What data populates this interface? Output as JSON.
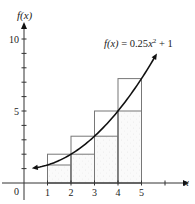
{
  "chart_data": {
    "type": "line",
    "title": "",
    "function_label": "f(x) = 0.25x² + 1",
    "function_label_parts": {
      "lhs": "f(x)",
      "eq": " = 0.25",
      "var": "x",
      "exp": "2",
      "tail": " + 1"
    },
    "xlabel": "x",
    "ylabel": "f(x)",
    "origin_label": "0",
    "xlim": [
      0,
      6.6
    ],
    "ylim": [
      0,
      11
    ],
    "x_ticks": [
      1,
      2,
      3,
      4,
      5,
      6
    ],
    "x_tick_labels": [
      "1",
      "2",
      "3",
      "4",
      "5"
    ],
    "y_ticks": [
      1,
      2,
      3,
      4,
      5,
      6,
      7,
      8,
      9,
      10
    ],
    "y_tick_labels": [
      {
        "value": 5,
        "label": "5"
      },
      {
        "value": 10,
        "label": "10"
      }
    ],
    "grid": false,
    "curve": {
      "a": 0.25,
      "b": 0,
      "c": 1,
      "x_start": 0.5,
      "x_end": 5.57
    },
    "series": [
      {
        "name": "f(x) = 0.25x^2 + 1",
        "x": [
          0.5,
          1,
          2,
          3,
          4,
          5,
          5.57
        ],
        "values": [
          1.0625,
          1.25,
          2,
          3.25,
          5,
          7.25,
          8.76
        ]
      }
    ],
    "rectangles": {
      "inscribed_shaded": [
        {
          "x0": 1,
          "x1": 2,
          "height": 1.25
        },
        {
          "x0": 2,
          "x1": 3,
          "height": 2
        },
        {
          "x0": 3,
          "x1": 4,
          "height": 3.25
        },
        {
          "x0": 4,
          "x1": 5,
          "height": 5
        }
      ],
      "circumscribed_outline": [
        {
          "x0": 1,
          "x1": 2,
          "height": 2
        },
        {
          "x0": 2,
          "x1": 3,
          "height": 3.25
        },
        {
          "x0": 3,
          "x1": 4,
          "height": 5
        },
        {
          "x0": 4,
          "x1": 5,
          "height": 7.25
        }
      ]
    },
    "colors": {
      "axis": "#333333",
      "curve": "#111111",
      "rect": "#777777",
      "shade": "#f1f1f1"
    }
  }
}
